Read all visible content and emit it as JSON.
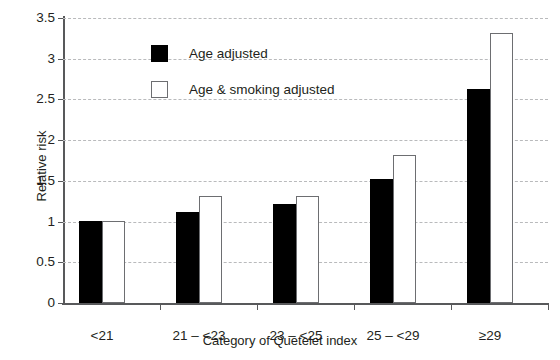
{
  "chart_data": {
    "type": "bar",
    "title": "",
    "xlabel": "Category of Quetelet index",
    "ylabel": "Relative risk",
    "categories": [
      "<21",
      "21 – <23",
      "23 – <25",
      "25 – <29",
      "≥29"
    ],
    "series": [
      {
        "name": "Age adjusted",
        "values": [
          1.01,
          1.12,
          1.22,
          1.52,
          2.63
        ],
        "color": "#000000",
        "style": "filled"
      },
      {
        "name": "Age & smoking adjusted",
        "values": [
          1.01,
          1.31,
          1.31,
          1.82,
          3.32
        ],
        "color": "#ffffff",
        "style": "outlined"
      }
    ],
    "ylim": [
      0,
      3.5
    ],
    "yticks": [
      0,
      0.5,
      1,
      1.5,
      2,
      2.5,
      3,
      3.5
    ],
    "ytick_labels": [
      "0",
      "0.5",
      "1",
      "1.5",
      "2",
      "2.5",
      "3",
      "3.5"
    ],
    "grid": true,
    "grid_axis": "y",
    "grid_style": "dashed",
    "grid_color": "#b9babc",
    "legend_position": "top-left",
    "axis_color": "#58595b"
  },
  "legend": {
    "entries": [
      {
        "label": "Age adjusted"
      },
      {
        "label": "Age & smoking adjusted"
      }
    ]
  }
}
